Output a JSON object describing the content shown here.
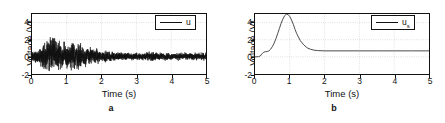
{
  "figure": {
    "panels": [
      {
        "caption": "a",
        "xlabel": "Time (s)",
        "ylabel": "Voltage (V)",
        "legend_label": "u",
        "legend_sub": "",
        "xticks": [
          "0",
          "1",
          "2",
          "3",
          "4",
          "5"
        ],
        "yticks": [
          "-2",
          "0",
          "2",
          "4"
        ]
      },
      {
        "caption": "b",
        "xlabel": "Time (s)",
        "ylabel": "Voltage (V)",
        "legend_label": "u",
        "legend_sub": "s",
        "xticks": [
          "0",
          "1",
          "2",
          "3",
          "4",
          "5"
        ],
        "yticks": [
          "-2",
          "0",
          "2",
          "4"
        ]
      }
    ]
  },
  "chart_data": [
    {
      "type": "line",
      "title": "a",
      "xlabel": "Time (s)",
      "ylabel": "Voltage (V)",
      "xlim": [
        0,
        5
      ],
      "ylim": [
        -2,
        5
      ],
      "xticks": [
        0,
        1,
        2,
        3,
        4,
        5
      ],
      "yticks": [
        -2,
        0,
        2,
        4
      ],
      "grid": true,
      "legend": [
        "u"
      ],
      "legend_position": "upper right",
      "series": [
        {
          "name": "u",
          "description": "Broadband random noise voltage; amplitude envelope rises from about 0.6 V near t=0 to a maximum near t=0.6-0.7 s where peaks reach about 3 V, then decays and settles to a small steady noise band of roughly +/-0.5 V after t=2.5 s. Mean value approximately 0 V.",
          "envelope_x": [
            0.0,
            0.2,
            0.4,
            0.6,
            0.7,
            0.9,
            1.1,
            1.3,
            1.5,
            1.8,
            2.1,
            2.5,
            3.0,
            3.5,
            4.0,
            4.5,
            5.0
          ],
          "envelope_upper": [
            0.7,
            1.3,
            2.3,
            3.1,
            2.9,
            2.1,
            2.0,
            2.2,
            1.7,
            1.2,
            0.9,
            0.7,
            0.6,
            0.7,
            0.6,
            0.6,
            0.6
          ],
          "envelope_lower": [
            -0.7,
            -1.2,
            -2.0,
            -2.0,
            -1.9,
            -2.0,
            -2.0,
            -2.0,
            -1.5,
            -1.0,
            -0.8,
            -0.6,
            -0.5,
            -0.6,
            -0.5,
            -0.5,
            -0.5
          ]
        }
      ]
    },
    {
      "type": "line",
      "title": "b",
      "xlabel": "Time (s)",
      "ylabel": "Voltage (V)",
      "xlim": [
        0,
        5
      ],
      "ylim": [
        -2,
        5
      ],
      "xticks": [
        0,
        1,
        2,
        3,
        4,
        5
      ],
      "yticks": [
        -2,
        0,
        2,
        4
      ],
      "grid": true,
      "legend": [
        "u_s"
      ],
      "legend_position": "upper right",
      "series": [
        {
          "name": "u_s",
          "description": "Smooth single-pulse voltage: flat near 0 V until t=0.15 s, a small shoulder near 0.25-0.35 s at about 0.6 V, then a steep rise to a peak of about 5 V at t=0.9 s, followed by a decay that settles to a constant level of about 0.7 V from t=1.8 s to t=5 s.",
          "x": [
            0.0,
            0.1,
            0.15,
            0.2,
            0.25,
            0.3,
            0.35,
            0.4,
            0.45,
            0.5,
            0.55,
            0.6,
            0.65,
            0.7,
            0.75,
            0.8,
            0.85,
            0.9,
            0.95,
            1.0,
            1.05,
            1.1,
            1.15,
            1.2,
            1.3,
            1.4,
            1.5,
            1.6,
            1.7,
            1.8,
            2.0,
            2.5,
            3.0,
            3.5,
            4.0,
            4.5,
            5.0
          ],
          "y": [
            0.0,
            0.02,
            0.1,
            0.35,
            0.55,
            0.6,
            0.62,
            0.7,
            0.9,
            1.2,
            1.6,
            2.1,
            2.7,
            3.3,
            3.9,
            4.4,
            4.8,
            4.98,
            4.95,
            4.7,
            4.3,
            3.8,
            3.2,
            2.7,
            1.9,
            1.4,
            1.05,
            0.88,
            0.78,
            0.73,
            0.7,
            0.7,
            0.7,
            0.7,
            0.7,
            0.7,
            0.7
          ]
        }
      ]
    }
  ]
}
